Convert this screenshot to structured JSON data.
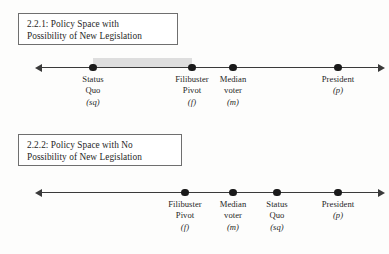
{
  "figure": {
    "panels": [
      {
        "id": "panel-1",
        "caption_line1": "2.2.1: Policy Space with",
        "caption_line2": "Possibility of New Legislation",
        "points": [
          {
            "name": "status-quo",
            "line1": "Status",
            "line2": "Quo",
            "symbol": "(sq)"
          },
          {
            "name": "filibuster-pivot",
            "line1": "Filibuster",
            "line2": "Pivot",
            "symbol": "(f)"
          },
          {
            "name": "median-voter",
            "line1": "Median",
            "line2": "voter",
            "symbol": "(m)"
          },
          {
            "name": "president",
            "line1": "President",
            "line2": "",
            "symbol": "(p)"
          }
        ]
      },
      {
        "id": "panel-2",
        "caption_line1": "2.2.2: Policy Space with No",
        "caption_line2": "Possibility of New Legislation",
        "points": [
          {
            "name": "filibuster-pivot",
            "line1": "Filibuster",
            "line2": "Pivot",
            "symbol": "(f)"
          },
          {
            "name": "median-voter",
            "line1": "Median",
            "line2": "voter",
            "symbol": "(m)"
          },
          {
            "name": "status-quo",
            "line1": "Status",
            "line2": "Quo",
            "symbol": "(sq)"
          },
          {
            "name": "president",
            "line1": "President",
            "line2": "",
            "symbol": "(p)"
          }
        ]
      }
    ],
    "colors": {
      "axis": "#3a3a3a",
      "dot": "#1a1a1a",
      "shade": "#d8d8d8",
      "box_border": "#6f6f6f",
      "text": "#1f1f1f"
    }
  }
}
